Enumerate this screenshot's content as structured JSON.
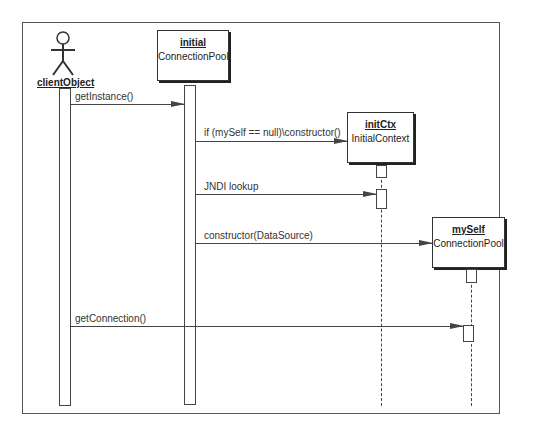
{
  "diagram": {
    "type": "UML sequence diagram",
    "participants": [
      {
        "id": "clientObject",
        "kind": "actor",
        "name": "clientObject",
        "class": ""
      },
      {
        "id": "initial",
        "kind": "object",
        "name": "initial",
        "class": "ConnectionPool"
      },
      {
        "id": "initCtx",
        "kind": "object",
        "name": "initCtx",
        "class": "InitialContext"
      },
      {
        "id": "mySelf",
        "kind": "object",
        "name": "mySelf",
        "class": "ConnectionPool"
      }
    ],
    "messages": [
      {
        "from": "clientObject",
        "to": "initial",
        "label": "getInstance()"
      },
      {
        "from": "initial",
        "to": "initCtx",
        "label": "if (mySelf == null)\\constructor()"
      },
      {
        "from": "initial",
        "to": "initCtx",
        "label": "JNDI lookup"
      },
      {
        "from": "initial",
        "to": "mySelf",
        "label": "constructor(DataSource)"
      },
      {
        "from": "clientObject",
        "to": "mySelf",
        "label": "getConnection()"
      }
    ],
    "colors": {
      "line": "#444444",
      "background": "#ffffff",
      "shadow": "#222222"
    }
  }
}
